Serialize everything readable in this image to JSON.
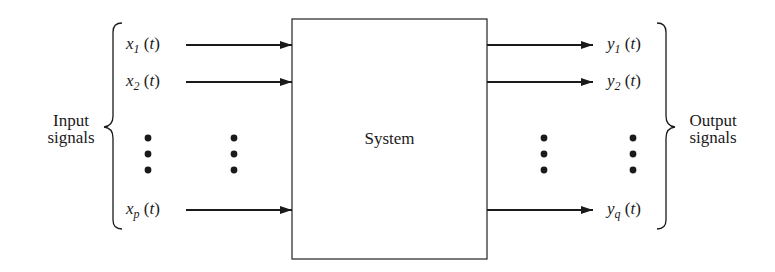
{
  "diagram": {
    "type": "block-diagram",
    "system": {
      "label": "System"
    },
    "inputs": {
      "group_label_line1": "Input",
      "group_label_line2": "signals",
      "signals": [
        {
          "var": "x",
          "sub": "1",
          "arg": "t"
        },
        {
          "var": "x",
          "sub": "2",
          "arg": "t"
        },
        {
          "var": "x",
          "sub": "p",
          "arg": "t"
        }
      ]
    },
    "outputs": {
      "group_label_line1": "Output",
      "group_label_line2": "signals",
      "signals": [
        {
          "var": "y",
          "sub": "1",
          "arg": "t"
        },
        {
          "var": "y",
          "sub": "2",
          "arg": "t"
        },
        {
          "var": "y",
          "sub": "q",
          "arg": "t"
        }
      ]
    },
    "ellipsis": "vertical dots",
    "colors": {
      "line": "#1a1a1a",
      "box_border": "#333333",
      "background": "#ffffff"
    }
  }
}
